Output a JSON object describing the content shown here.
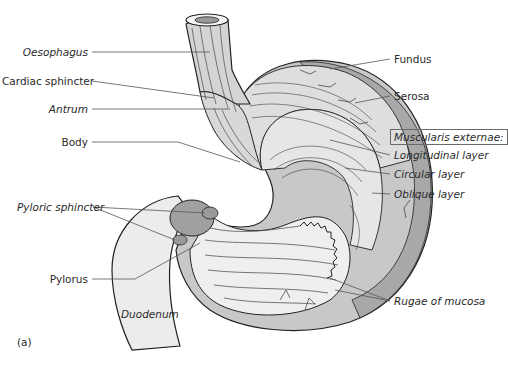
{
  "figure": {
    "panel_label": "(a)",
    "colors": {
      "tissue_light": "#dcdcdc",
      "tissue_mid": "#bfbfbf",
      "tissue_dark": "#9a9a9a",
      "outline": "#222222",
      "leader": "#555555"
    }
  },
  "labels_left": {
    "oesophagus": "Oesophagus",
    "cardiac_sphincter": "Cardiac sphincter",
    "antrum": "Antrum",
    "body": "Body",
    "pyloric_sphincter": "Pyloric sphincter",
    "pylorus": "Pylorus"
  },
  "labels_right": {
    "fundus": "Fundus",
    "serosa": "Serosa",
    "muscularis_externae": "Muscularis externae:",
    "longitudinal_layer": "Longitudinal layer",
    "circular_layer": "Circular layer",
    "oblique_layer": "Oblique layer",
    "rugae_of_mucosa": "Rugae of mucosa"
  },
  "labels_inline": {
    "duodenum": "Duodenum"
  }
}
